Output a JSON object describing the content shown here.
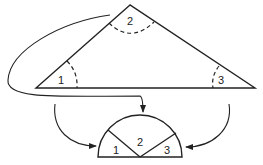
{
  "diagram": {
    "triangle": {
      "vertices": {
        "top": [
          130,
          5
        ],
        "left": [
          36,
          88
        ],
        "right": [
          255,
          88
        ]
      },
      "angles": [
        {
          "label": "1",
          "position": "left"
        },
        {
          "label": "2",
          "position": "top"
        },
        {
          "label": "3",
          "position": "right"
        }
      ]
    },
    "semicircle": {
      "center": [
        140,
        157
      ],
      "radius": 42,
      "sectors": [
        {
          "label": "1"
        },
        {
          "label": "2"
        },
        {
          "label": "3"
        }
      ]
    },
    "arrows": [
      {
        "from": "angle-2",
        "to": "semicircle-top"
      },
      {
        "from": "angle-1",
        "to": "semicircle-left"
      },
      {
        "from": "angle-3",
        "to": "semicircle-right"
      }
    ],
    "colors": {
      "stroke": "#222222",
      "background": "#ffffff"
    }
  }
}
